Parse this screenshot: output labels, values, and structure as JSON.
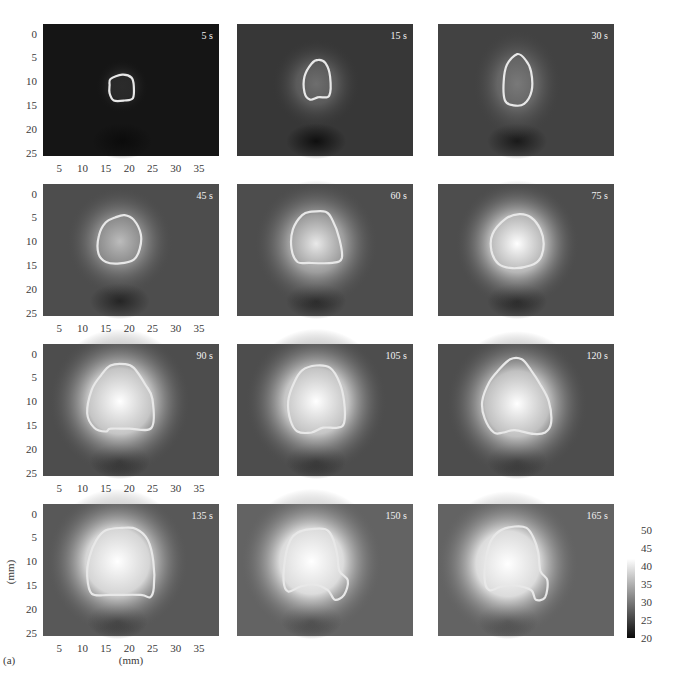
{
  "chart_data": {
    "type": "heatmap",
    "title": "",
    "panel_label": "(a)",
    "xlabel": "(mm)",
    "ylabel": "(mm)",
    "xlim": [
      1.5,
      39.3
    ],
    "ylim": [
      -2,
      25.6
    ],
    "x_ticks": [
      5,
      10,
      15,
      20,
      25,
      30,
      35
    ],
    "y_ticks": [
      0,
      5,
      10,
      15,
      20,
      25
    ],
    "grid": false,
    "layout": "4 rows x 3 columns, ticks shown on first column only",
    "colorbar": {
      "ticks": [
        50,
        45,
        40,
        35,
        30,
        25,
        20
      ],
      "range": [
        20,
        50
      ],
      "colormap": "grayscale (dark = 20, white >= 42)",
      "placement": "right of bottom row"
    },
    "panels": [
      {
        "time_label": "5 s",
        "background": 21,
        "peak": 23,
        "center": [
          18.5,
          11.0
        ],
        "spread": [
          3,
          3
        ],
        "outline": [
          [
            16,
            9.5
          ],
          [
            18.5,
            8.6
          ],
          [
            20.5,
            9.2
          ],
          [
            21,
            11
          ],
          [
            20.8,
            13.5
          ],
          [
            19,
            14
          ],
          [
            16.7,
            14
          ],
          [
            15.8,
            12.5
          ],
          [
            15.8,
            10.8
          ]
        ]
      },
      {
        "time_label": "15 s",
        "background": 24,
        "peak": 29,
        "center": [
          18.5,
          10.5
        ],
        "spread": [
          5,
          5
        ],
        "outline": [
          [
            17.5,
            6.3
          ],
          [
            19,
            5.5
          ],
          [
            20.5,
            6.2
          ],
          [
            21.5,
            9
          ],
          [
            21.3,
            13
          ],
          [
            19,
            13.3
          ],
          [
            17.2,
            13.8
          ],
          [
            16,
            12.3
          ],
          [
            16,
            9
          ]
        ]
      },
      {
        "time_label": "30 s",
        "background": 25,
        "peak": 30,
        "center": [
          18.5,
          10.5
        ],
        "spread": [
          5,
          6
        ],
        "outline": [
          [
            18.5,
            4.3
          ],
          [
            20.3,
            5.5
          ],
          [
            21.5,
            8
          ],
          [
            21.6,
            12
          ],
          [
            20,
            14.7
          ],
          [
            17.7,
            15
          ],
          [
            15.9,
            14
          ],
          [
            15.6,
            10
          ],
          [
            16.3,
            6.5
          ]
        ]
      },
      {
        "time_label": "45 s",
        "background": 26,
        "peak": 36,
        "center": [
          18,
          10
        ],
        "spread": [
          6,
          6
        ],
        "outline": [
          [
            17,
            5
          ],
          [
            19,
            4.5
          ],
          [
            21,
            5.5
          ],
          [
            22.5,
            8.5
          ],
          [
            22.3,
            11.5
          ],
          [
            21,
            13.8
          ],
          [
            18,
            14.6
          ],
          [
            15,
            14.3
          ],
          [
            13.4,
            12.5
          ],
          [
            13.5,
            8.8
          ],
          [
            15,
            6
          ]
        ]
      },
      {
        "time_label": "60 s",
        "background": 26,
        "peak": 40,
        "center": [
          18.5,
          10.5
        ],
        "spread": [
          7,
          7
        ],
        "outline": [
          [
            15.5,
            4.5
          ],
          [
            17.5,
            3.8
          ],
          [
            20.5,
            3.8
          ],
          [
            22,
            5.5
          ],
          [
            23.5,
            9.5
          ],
          [
            24,
            13.5
          ],
          [
            22,
            14.5
          ],
          [
            17,
            14.5
          ],
          [
            14.5,
            14.3
          ],
          [
            13.2,
            11.5
          ],
          [
            13.5,
            7.5
          ]
        ]
      },
      {
        "time_label": "75 s",
        "background": 26,
        "peak": 45,
        "center": [
          18.5,
          10.5
        ],
        "spread": [
          7,
          7
        ],
        "outline": [
          [
            16,
            5.3
          ],
          [
            19,
            4.3
          ],
          [
            21.5,
            5
          ],
          [
            23.5,
            7.5
          ],
          [
            24.2,
            10.5
          ],
          [
            23.5,
            13.5
          ],
          [
            21.5,
            15
          ],
          [
            17.5,
            15.6
          ],
          [
            14.5,
            14.7
          ],
          [
            13,
            12
          ],
          [
            13.2,
            8.5
          ]
        ]
      },
      {
        "time_label": "90 s",
        "background": 26,
        "peak": 48,
        "center": [
          18,
          10
        ],
        "spread": [
          8,
          8
        ],
        "outline": [
          [
            16,
            2.5
          ],
          [
            19,
            2.2
          ],
          [
            21,
            3
          ],
          [
            23.5,
            6.5
          ],
          [
            25,
            9.5
          ],
          [
            24.8,
            15.5
          ],
          [
            20,
            15.7
          ],
          [
            16,
            15.7
          ],
          [
            15,
            16.3
          ],
          [
            12.5,
            15.5
          ],
          [
            11,
            12.5
          ],
          [
            12,
            7.5
          ],
          [
            14,
            4.5
          ]
        ]
      },
      {
        "time_label": "105 s",
        "background": 26,
        "peak": 48,
        "center": [
          18.5,
          10
        ],
        "spread": [
          8,
          8
        ],
        "outline": [
          [
            15.5,
            3.5
          ],
          [
            18.5,
            2.5
          ],
          [
            21.5,
            3
          ],
          [
            23.5,
            6
          ],
          [
            24.5,
            10
          ],
          [
            24.5,
            14.5
          ],
          [
            23,
            15.5
          ],
          [
            20,
            15.5
          ],
          [
            17.5,
            16.5
          ],
          [
            14.5,
            16.3
          ],
          [
            13,
            14
          ],
          [
            12.5,
            10
          ],
          [
            13.8,
            6
          ]
        ]
      },
      {
        "time_label": "120 s",
        "background": 26,
        "peak": 47,
        "center": [
          18.5,
          10.5
        ],
        "spread": [
          8,
          8
        ],
        "outline": [
          [
            17,
            1.2
          ],
          [
            19.5,
            1.2
          ],
          [
            21.5,
            3.5
          ],
          [
            23.5,
            6.5
          ],
          [
            25.3,
            10
          ],
          [
            25.8,
            14.5
          ],
          [
            24.5,
            16.5
          ],
          [
            22,
            16.8
          ],
          [
            18,
            16
          ],
          [
            15.5,
            16.5
          ],
          [
            13.5,
            16.5
          ],
          [
            11.5,
            13.5
          ],
          [
            11,
            10
          ],
          [
            12.5,
            6
          ],
          [
            14.5,
            3.5
          ]
        ]
      },
      {
        "time_label": "135 s",
        "background": 27,
        "peak": 50,
        "center": [
          17.5,
          10
        ],
        "spread": [
          8,
          8
        ],
        "outline": [
          [
            15,
            3.5
          ],
          [
            18.5,
            3
          ],
          [
            21.5,
            3.2
          ],
          [
            24,
            5.5
          ],
          [
            25.2,
            10
          ],
          [
            25.3,
            15.5
          ],
          [
            24.5,
            17.5
          ],
          [
            22.5,
            17
          ],
          [
            16,
            17
          ],
          [
            12,
            16.8
          ],
          [
            11,
            13
          ],
          [
            11.5,
            9
          ],
          [
            13,
            5.5
          ]
        ]
      },
      {
        "time_label": "150 s",
        "background": 28,
        "peak": 50,
        "center": [
          17.5,
          10
        ],
        "spread": [
          8,
          8
        ],
        "outline": [
          [
            14.5,
            4
          ],
          [
            17,
            3.3
          ],
          [
            20.5,
            3.3
          ],
          [
            22,
            5
          ],
          [
            23,
            8.5
          ],
          [
            23.5,
            12
          ],
          [
            25.3,
            14
          ],
          [
            24.5,
            17
          ],
          [
            22.5,
            18
          ],
          [
            21,
            16
          ],
          [
            18,
            14.8
          ],
          [
            15,
            15.3
          ],
          [
            12.5,
            16.3
          ],
          [
            11.5,
            14
          ],
          [
            12,
            8.5
          ],
          [
            13,
            5.5
          ]
        ]
      },
      {
        "time_label": "165 s",
        "background": 28,
        "peak": 50,
        "center": [
          16.5,
          10.5
        ],
        "spread": [
          8,
          8
        ],
        "outline": [
          [
            15,
            3.5
          ],
          [
            18,
            2.7
          ],
          [
            20.5,
            3
          ],
          [
            22,
            5
          ],
          [
            23,
            8
          ],
          [
            23.5,
            12
          ],
          [
            25,
            14
          ],
          [
            24.5,
            17.5
          ],
          [
            22.5,
            18
          ],
          [
            21.5,
            16
          ],
          [
            18,
            15
          ],
          [
            15,
            15.3
          ],
          [
            12.5,
            16
          ],
          [
            11.5,
            13.5
          ],
          [
            12,
            8.5
          ],
          [
            13,
            5.5
          ]
        ]
      }
    ]
  }
}
